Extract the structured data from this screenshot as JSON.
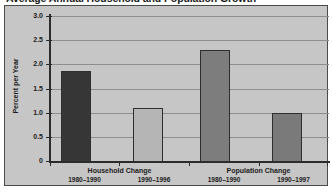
{
  "chart_data": {
    "type": "bar",
    "title": "Average Annual Household and Population Growth",
    "xlabel": "",
    "ylabel": "Percent per Year",
    "ylim": [
      0,
      3.0
    ],
    "ytick_labels": [
      "3.0",
      "2.5",
      "2.0",
      "1.5",
      "1.0",
      "0.5",
      "0"
    ],
    "ytick_values": [
      3.0,
      2.5,
      2.0,
      1.5,
      1.0,
      0.5,
      0
    ],
    "grid": true,
    "legend": "none",
    "groups": [
      {
        "label": "Household Change",
        "bars": [
          {
            "period": "1980–1990",
            "value": 1.87,
            "color": "#363636"
          },
          {
            "period": "1990–1996",
            "value": 1.1,
            "color": "#b5b5b5"
          }
        ]
      },
      {
        "label": "Population Change",
        "bars": [
          {
            "period": "1980–1990",
            "value": 2.3,
            "color": "#7d7d7d"
          },
          {
            "period": "1990–1997",
            "value": 1.0,
            "color": "#7a7a7a"
          }
        ]
      }
    ],
    "categories": [
      "Household Change 1980–1990",
      "Household Change 1990–1996",
      "Population Change 1980–1990",
      "Population Change 1990–1997"
    ],
    "values": [
      1.87,
      1.1,
      2.3,
      1.0
    ],
    "colors": {
      "plot_background": "#c6c6c6",
      "frame_border": "#4a4a4a",
      "gridline": "#8e8e8e",
      "axis": "#2b2b2b",
      "text": "#1b1b1b"
    }
  }
}
